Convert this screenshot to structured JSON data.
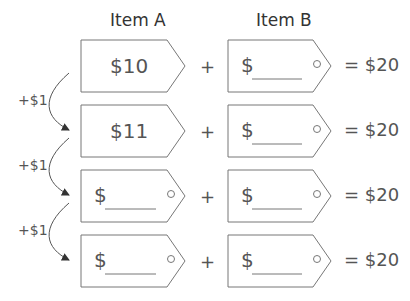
{
  "headers": {
    "item_a": "Item A",
    "item_b": "Item B"
  },
  "rows": [
    {
      "a_value": "$10",
      "a_blank": false,
      "b_prefix": "$",
      "plus": "+",
      "equals": "= $20"
    },
    {
      "a_value": "$11",
      "a_blank": false,
      "b_prefix": "$",
      "plus": "+",
      "equals": "= $20"
    },
    {
      "a_value": "$",
      "a_blank": true,
      "b_prefix": "$",
      "plus": "+",
      "equals": "= $20"
    },
    {
      "a_value": "$",
      "a_blank": true,
      "b_prefix": "$",
      "plus": "+",
      "equals": "= $20"
    }
  ],
  "arrows": [
    {
      "label": "+$1"
    },
    {
      "label": "+$1"
    },
    {
      "label": "+$1"
    }
  ],
  "colors": {
    "stroke": "#777777",
    "text": "#555555"
  }
}
